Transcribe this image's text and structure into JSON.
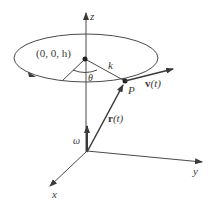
{
  "figure": {
    "labels": {
      "z_axis": "z",
      "x_axis": "x",
      "y_axis": "y",
      "center_point": "(0, 0, h)",
      "radius": "k",
      "angle": "θ",
      "point": "P",
      "velocity_bold": "v",
      "velocity_arg": "(t)",
      "position_bold": "r",
      "position_arg": "(t)",
      "angular_velocity": "ω"
    },
    "colors": {
      "line": "#4a4a4a",
      "arrow": "#3a3a3a",
      "text": "#3a3a3a",
      "background": "#ffffff"
    }
  }
}
